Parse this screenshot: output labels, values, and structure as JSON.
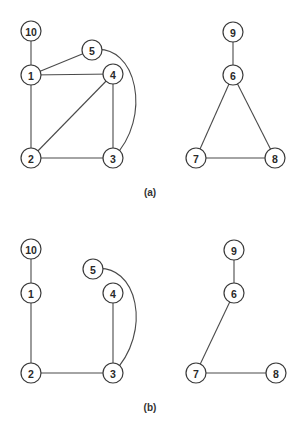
{
  "figure": {
    "node_radius": 10,
    "panels": [
      {
        "id": "a",
        "caption": "(a)",
        "caption_pos": [
          150,
          196
        ],
        "nodes": [
          {
            "id": "10",
            "label": "10",
            "x": 31,
            "y": 31
          },
          {
            "id": "1",
            "label": "1",
            "x": 31,
            "y": 75
          },
          {
            "id": "5",
            "label": "5",
            "x": 92,
            "y": 50
          },
          {
            "id": "4",
            "label": "4",
            "x": 113,
            "y": 74
          },
          {
            "id": "2",
            "label": "2",
            "x": 31,
            "y": 158
          },
          {
            "id": "3",
            "label": "3",
            "x": 113,
            "y": 158
          },
          {
            "id": "9",
            "label": "9",
            "x": 233,
            "y": 32
          },
          {
            "id": "6",
            "label": "6",
            "x": 233,
            "y": 75
          },
          {
            "id": "7",
            "label": "7",
            "x": 196,
            "y": 158
          },
          {
            "id": "8",
            "label": "8",
            "x": 275,
            "y": 158
          }
        ],
        "edges": [
          {
            "from": "10",
            "to": "1"
          },
          {
            "from": "1",
            "to": "5"
          },
          {
            "from": "1",
            "to": "4"
          },
          {
            "from": "1",
            "to": "2"
          },
          {
            "from": "2",
            "to": "4"
          },
          {
            "from": "2",
            "to": "3"
          },
          {
            "from": "4",
            "to": "3"
          },
          {
            "from": "5",
            "to": "3",
            "curved": true
          },
          {
            "from": "9",
            "to": "6"
          },
          {
            "from": "6",
            "to": "7"
          },
          {
            "from": "6",
            "to": "8"
          },
          {
            "from": "7",
            "to": "8"
          }
        ]
      },
      {
        "id": "b",
        "caption": "(b)",
        "caption_pos": [
          150,
          411
        ],
        "nodes": [
          {
            "id": "10",
            "label": "10",
            "x": 31,
            "y": 249
          },
          {
            "id": "1",
            "label": "1",
            "x": 31,
            "y": 293
          },
          {
            "id": "5",
            "label": "5",
            "x": 93,
            "y": 269
          },
          {
            "id": "4",
            "label": "4",
            "x": 113,
            "y": 293
          },
          {
            "id": "2",
            "label": "2",
            "x": 31,
            "y": 373
          },
          {
            "id": "3",
            "label": "3",
            "x": 113,
            "y": 373
          },
          {
            "id": "9",
            "label": "9",
            "x": 234,
            "y": 250
          },
          {
            "id": "6",
            "label": "6",
            "x": 234,
            "y": 293
          },
          {
            "id": "7",
            "label": "7",
            "x": 196,
            "y": 373
          },
          {
            "id": "8",
            "label": "8",
            "x": 276,
            "y": 373
          }
        ],
        "edges": [
          {
            "from": "10",
            "to": "1"
          },
          {
            "from": "1",
            "to": "2"
          },
          {
            "from": "2",
            "to": "3"
          },
          {
            "from": "4",
            "to": "3"
          },
          {
            "from": "5",
            "to": "3",
            "curved": true
          },
          {
            "from": "9",
            "to": "6"
          },
          {
            "from": "6",
            "to": "7"
          },
          {
            "from": "7",
            "to": "8"
          }
        ]
      }
    ]
  }
}
